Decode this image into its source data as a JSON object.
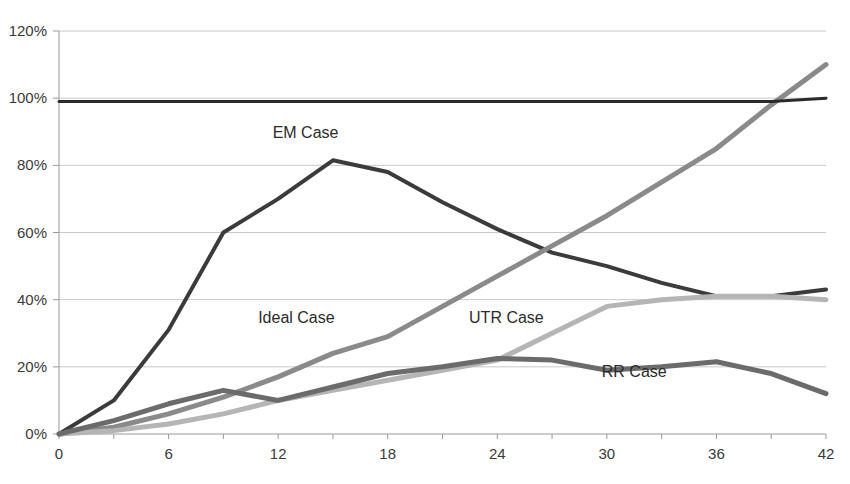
{
  "chart_data": {
    "type": "line",
    "title": "",
    "subtitle": "",
    "xlabel": "",
    "ylabel": "",
    "xlim": [
      0,
      42
    ],
    "ylim": [
      0,
      120
    ],
    "grid": true,
    "gridlines": "horizontal",
    "legend_position": "inline-labels",
    "x_ticks": [
      "0",
      "6",
      "12",
      "18",
      "24",
      "30",
      "36",
      "42"
    ],
    "x_tick_values": [
      0,
      6,
      12,
      18,
      24,
      30,
      36,
      42
    ],
    "y_ticks": [
      "0%",
      "20%",
      "40%",
      "60%",
      "80%",
      "100%",
      "120%"
    ],
    "y_tick_values": [
      0,
      20,
      40,
      60,
      80,
      100,
      120
    ],
    "x": [
      0,
      3,
      6,
      9,
      12,
      15,
      18,
      21,
      24,
      27,
      30,
      33,
      36,
      39,
      42
    ],
    "series": [
      {
        "name": "EM Case",
        "label": "EM Case",
        "color": "#3b3b3b",
        "width": 4,
        "label_x": 13.5,
        "label_y": 88,
        "values": [
          0,
          10,
          31,
          60,
          70,
          81.5,
          78,
          69,
          61,
          54,
          50,
          45,
          41,
          41,
          43
        ]
      },
      {
        "name": "Ideal Case",
        "label": "Ideal Case",
        "color": "#8a8a8a",
        "width": 5,
        "label_x": 13.0,
        "label_y": 33,
        "values": [
          0,
          2,
          6,
          11,
          17,
          24,
          29,
          38,
          47,
          56,
          65,
          75,
          85,
          98,
          110
        ]
      },
      {
        "name": "UTR Case",
        "label": "UTR Case",
        "color": "#b5b5b5",
        "width": 5,
        "label_x": 24.5,
        "label_y": 33,
        "values": [
          0,
          1,
          3,
          6,
          10,
          13,
          16,
          19,
          22,
          30,
          38,
          40,
          41,
          41,
          40
        ]
      },
      {
        "name": "RR Case",
        "label": "RR Case",
        "color": "#6b6b6b",
        "width": 5,
        "label_x": 31.5,
        "label_y": 17,
        "values": [
          0,
          4,
          9,
          13,
          10,
          14,
          18,
          20,
          22.5,
          22,
          19,
          20,
          21.5,
          18,
          12
        ]
      },
      {
        "name": "Reference Line",
        "label": "",
        "color": "#2a2a2a",
        "width": 3,
        "label_x": null,
        "label_y": null,
        "values": [
          99,
          99,
          99,
          99,
          99,
          99,
          99,
          99,
          99,
          99,
          99,
          99,
          99,
          99,
          100
        ]
      }
    ],
    "colors": {
      "em_case": "#3b3b3b",
      "ideal_case": "#8a8a8a",
      "utr_case": "#b5b5b5",
      "rr_case": "#6b6b6b",
      "reference": "#2a2a2a",
      "grid": "#c8c8c8",
      "axis": "#9a9a9a",
      "tick_text": "#3a3a3a"
    }
  }
}
